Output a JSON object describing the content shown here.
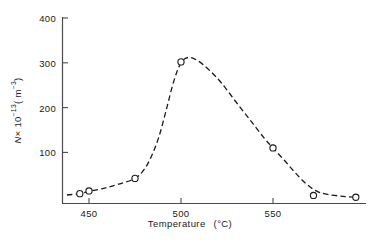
{
  "chart_data": {
    "type": "scatter",
    "title": "",
    "xlabel": "Temperature   (°C)",
    "ylabel": "N × 10⁻¹³ (m⁻³)",
    "xlim": [
      435,
      600
    ],
    "ylim": [
      -14,
      400
    ],
    "grid": false,
    "legend": null,
    "xticks": [
      450,
      500,
      550
    ],
    "xtick_labels": [
      "450",
      "500",
      "550"
    ],
    "yticks": [
      100,
      200,
      300,
      400
    ],
    "ytick_labels": [
      "100",
      "200",
      "300",
      "400"
    ],
    "marker": "open-circle",
    "line_style": "dashed",
    "line_color": "#1a1a1a",
    "marker_edge_color": "#1a1a1a",
    "marker_face_color": "#ffffff",
    "x": [
      445,
      450,
      475,
      500,
      550,
      572,
      595
    ],
    "y": [
      8,
      14,
      42,
      302,
      110,
      4,
      0
    ],
    "points": [
      {
        "x": 445,
        "y": 8
      },
      {
        "x": 450,
        "y": 14
      },
      {
        "x": 475,
        "y": 42
      },
      {
        "x": 500,
        "y": 302
      },
      {
        "x": 550,
        "y": 110
      },
      {
        "x": 572,
        "y": 4
      },
      {
        "x": 595,
        "y": 0
      }
    ],
    "curve": [
      {
        "x": 438,
        "y": 5
      },
      {
        "x": 445,
        "y": 8
      },
      {
        "x": 450,
        "y": 13
      },
      {
        "x": 458,
        "y": 20
      },
      {
        "x": 466,
        "y": 29
      },
      {
        "x": 475,
        "y": 42
      },
      {
        "x": 480,
        "y": 62
      },
      {
        "x": 484,
        "y": 92
      },
      {
        "x": 488,
        "y": 135
      },
      {
        "x": 492,
        "y": 195
      },
      {
        "x": 496,
        "y": 258
      },
      {
        "x": 500,
        "y": 300
      },
      {
        "x": 504,
        "y": 312
      },
      {
        "x": 509,
        "y": 305
      },
      {
        "x": 515,
        "y": 285
      },
      {
        "x": 522,
        "y": 255
      },
      {
        "x": 530,
        "y": 212
      },
      {
        "x": 538,
        "y": 170
      },
      {
        "x": 545,
        "y": 133
      },
      {
        "x": 550,
        "y": 110
      },
      {
        "x": 556,
        "y": 83
      },
      {
        "x": 562,
        "y": 55
      },
      {
        "x": 568,
        "y": 30
      },
      {
        "x": 574,
        "y": 13
      },
      {
        "x": 580,
        "y": 6
      },
      {
        "x": 588,
        "y": 2
      },
      {
        "x": 595,
        "y": 0
      }
    ]
  },
  "axis": {
    "x_title_main": "Temperature",
    "x_title_unit": "(°C)",
    "y_title_var": "N",
    "y_title_times": "× 10",
    "y_title_exp1": "−13",
    "y_title_open": "( m",
    "y_title_exp2": "−3",
    "y_title_close": ")"
  }
}
